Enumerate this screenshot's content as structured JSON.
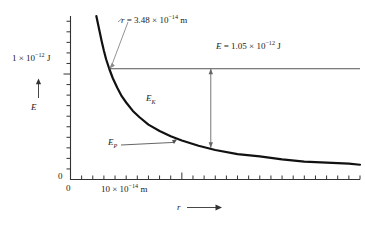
{
  "chart_data": {
    "type": "line",
    "title": "",
    "xlabel": "r",
    "ylabel": "E",
    "xlabel_arrow": "⟶",
    "ylabel_arrow": "↑",
    "grid": false,
    "legend": "none",
    "xlim": [
      0,
      26
    ],
    "ylim": [
      0,
      1.55
    ],
    "x_unit_text": "10 × 10",
    "x_unit_exponent": "−14",
    "x_unit_suffix": " m",
    "x_tick_label_value": 10,
    "x_origin_label": "0",
    "y_origin_label": "0",
    "y_tick_label_mantissa": "1 × 10",
    "y_tick_label_exponent": "−12",
    "y_tick_label_suffix": " J",
    "y_tick_label_value": 1.0,
    "series": [
      {
        "name": "E_P",
        "label": "E",
        "label_sub": "P",
        "description": "Coulomb potential energy curve, E_P proportional to 1/r",
        "style": "solid-thick",
        "color": "#111111",
        "x": [
          2.6,
          2.8,
          3.0,
          3.2,
          3.48,
          3.8,
          4.2,
          4.6,
          5.0,
          5.6,
          6.2,
          7.0,
          8.0,
          9.0,
          10.0,
          11.5,
          13.0,
          15.0,
          17.0,
          19.0,
          21.0,
          23.0,
          25.0,
          26.0
        ],
        "y": [
          1.41,
          1.31,
          1.22,
          1.14,
          1.05,
          0.96,
          0.87,
          0.79,
          0.73,
          0.65,
          0.59,
          0.52,
          0.46,
          0.41,
          0.37,
          0.32,
          0.28,
          0.24,
          0.22,
          0.19,
          0.17,
          0.16,
          0.15,
          0.14
        ]
      },
      {
        "name": "E_total",
        "label": "E",
        "description": "Total energy, constant horizontal line",
        "style": "solid-thin",
        "color": "#555555",
        "constant_y": 1.05,
        "x_start": 3.48,
        "x_end": 26.0
      }
    ],
    "annotations": [
      {
        "name": "radius-annotation",
        "text_prefix": "r",
        "text_eq": " = 3.48 × 10",
        "text_exponent": "−14",
        "text_suffix": " m",
        "points_to_x": 3.48,
        "points_to_y": 1.05
      },
      {
        "name": "energy-annotation",
        "text_prefix": "E",
        "text_eq": " = 1.05 × 10",
        "text_exponent": "−12",
        "text_suffix": " J",
        "value": 1.05
      },
      {
        "name": "kinetic-energy-arrow",
        "label": "E",
        "label_sub": "K",
        "at_x": 12.6,
        "from_y": 1.05,
        "to_y": 0.3,
        "arrow": "double-headed"
      },
      {
        "name": "potential-energy-pointer",
        "label": "E",
        "label_sub": "P",
        "points_to_x": 9.6,
        "points_to_y": 0.385
      }
    ]
  },
  "axes": {
    "y_axis_name": "E",
    "x_axis_name": "r"
  },
  "colors": {
    "curve": "#111111",
    "energy_line": "#555555",
    "axis": "#333333",
    "annotation_leader": "#777777",
    "background": "#ffffff"
  }
}
